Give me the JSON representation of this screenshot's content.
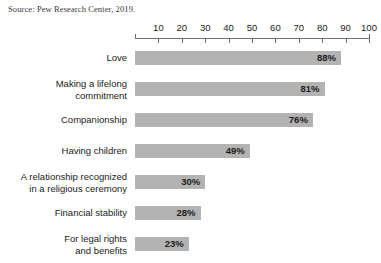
{
  "source_note": "Source: Pew Research Center, 2019.",
  "chart_data": {
    "type": "bar",
    "orientation": "horizontal",
    "title": "",
    "subtitle": "",
    "xlabel": "",
    "ylabel": "",
    "xlim": [
      0,
      100
    ],
    "grid": false,
    "legend": null,
    "value_suffix": "%",
    "bar_color": "#b3b3b3",
    "axis_color": "#6e6e6e",
    "text_color": "#1b1b1b",
    "xticks": [
      10,
      20,
      30,
      40,
      50,
      60,
      70,
      80,
      90,
      100
    ],
    "xtick_labels": [
      "10",
      "20",
      "30",
      "40",
      "50",
      "60",
      "70",
      "80",
      "90",
      "100"
    ],
    "categories": [
      "Love",
      "Making a lifelong\ncommitment",
      "Companionship",
      "Having children",
      "A relationship recognized\nin a religious ceremony",
      "Financial stability",
      "For legal rights\nand benefits"
    ],
    "values": [
      88,
      81,
      76,
      49,
      30,
      28,
      23
    ],
    "value_labels": [
      "88%",
      "81%",
      "76%",
      "49%",
      "30%",
      "28%",
      "23%"
    ]
  }
}
